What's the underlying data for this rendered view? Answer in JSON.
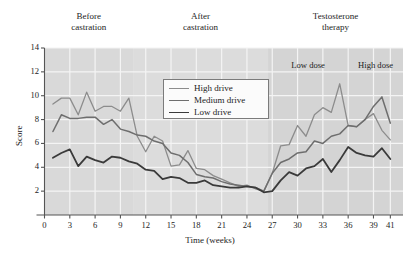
{
  "chart_data": {
    "type": "line",
    "title": "",
    "xlabel": "Time (weeks)",
    "ylabel": "Score",
    "xlim": [
      0,
      42.5
    ],
    "ylim": [
      0,
      14
    ],
    "xticks": [
      0,
      3,
      6,
      9,
      12,
      15,
      18,
      21,
      24,
      27,
      30,
      33,
      36,
      39,
      41
    ],
    "yticks": [
      2,
      4,
      6,
      8,
      10,
      12,
      14
    ],
    "grid": true,
    "legend_position": "upper-center",
    "x": [
      1,
      2,
      3,
      4,
      5,
      6,
      7,
      8,
      9,
      10,
      11,
      12,
      13,
      14,
      15,
      16,
      17,
      18,
      19,
      20,
      21,
      22,
      23,
      24,
      25,
      26,
      27,
      28,
      29,
      30,
      31,
      32,
      33,
      34,
      35,
      36,
      37,
      38,
      39,
      40,
      41
    ],
    "series": [
      {
        "name": "High drive",
        "color": "#8c8c8c",
        "width": 1.3,
        "values": [
          9.3,
          9.8,
          9.8,
          8.4,
          10.3,
          8.7,
          9.1,
          9.1,
          8.7,
          9.8,
          6.6,
          5.3,
          6.6,
          6.2,
          4.1,
          4.2,
          5.4,
          3.9,
          3.8,
          3.3,
          3.0,
          2.7,
          2.4,
          2.5,
          2.2,
          2.0,
          3.5,
          5.8,
          5.9,
          7.5,
          6.6,
          8.4,
          9.0,
          8.6,
          11.0,
          7.5,
          7.4,
          8.0,
          8.5,
          7.1,
          6.3
        ]
      },
      {
        "name": "Medium drive",
        "color": "#6e6e6e",
        "width": 1.5,
        "values": [
          7.0,
          8.4,
          8.1,
          8.1,
          8.2,
          8.2,
          7.6,
          8.0,
          7.2,
          7.0,
          6.7,
          6.6,
          6.2,
          6.0,
          5.2,
          5.0,
          4.4,
          3.4,
          3.2,
          3.1,
          2.8,
          2.6,
          2.5,
          2.4,
          2.3,
          2.0,
          3.5,
          4.4,
          4.7,
          5.2,
          5.3,
          6.2,
          6.0,
          6.6,
          6.8,
          7.5,
          7.4,
          8.0,
          9.1,
          9.9,
          7.7
        ]
      },
      {
        "name": "Low drive",
        "color": "#3a3a3a",
        "width": 1.8,
        "values": [
          4.8,
          5.2,
          5.5,
          4.1,
          4.9,
          4.6,
          4.4,
          4.9,
          4.8,
          4.5,
          4.3,
          3.8,
          3.7,
          3.0,
          3.2,
          3.1,
          2.7,
          2.7,
          2.9,
          2.5,
          2.4,
          2.3,
          2.3,
          2.4,
          2.3,
          1.9,
          2.0,
          2.9,
          3.6,
          3.3,
          3.9,
          4.1,
          4.7,
          3.6,
          4.6,
          5.7,
          5.2,
          5.0,
          4.9,
          5.6,
          4.7
        ]
      }
    ],
    "phases": [
      {
        "label": "Before\ncastration",
        "line1": "Before",
        "line2": "castration",
        "x_start": 0,
        "x_end": 10.5
      },
      {
        "label": "After\ncastration",
        "line1": "After",
        "line2": "castration",
        "x_start": 10.5,
        "x_end": 26.5
      },
      {
        "label": "Testosterone\ntherapy",
        "line1": "Testosterone",
        "line2": "therapy",
        "x_start": 26.5,
        "x_end": 42.5
      }
    ],
    "dose_bands": [
      {
        "label": "Low dose",
        "x_start": 26.5,
        "x_end": 36.0
      },
      {
        "label": "High dose",
        "x_start": 36.0,
        "x_end": 42.5
      }
    ],
    "band_colors": {
      "before": "#d9d9d9",
      "after": "#dcdcdc",
      "therapy": "#d4d4d4",
      "grid": "#f4f4f4",
      "axis": "#555555"
    }
  }
}
